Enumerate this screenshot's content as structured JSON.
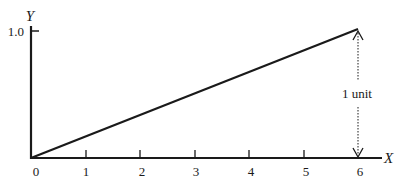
{
  "diagram": {
    "axes": {
      "y_label": "Y",
      "x_label": "X",
      "y_tick_label": "1.0",
      "origin_label": "0",
      "x_ticks": [
        "1",
        "2",
        "3",
        "4",
        "5",
        "6"
      ]
    },
    "line": {
      "from": [
        0,
        0
      ],
      "to": [
        6,
        1.0
      ]
    },
    "annotation": {
      "label": "1 unit",
      "style": "dotted double-headed arrow",
      "at_x": 6
    },
    "colors": {
      "ink": "#1a1a1a",
      "background": "#ffffff"
    }
  }
}
